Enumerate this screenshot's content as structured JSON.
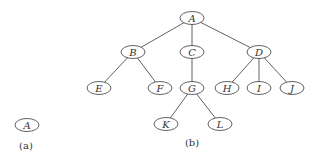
{
  "diagram": {
    "type": "tree",
    "panels": [
      {
        "id": "a",
        "caption": "(a)",
        "nodes": [
          {
            "id": "a_A",
            "label": "A",
            "x": 27,
            "y": 125
          }
        ],
        "edges": []
      },
      {
        "id": "b",
        "caption": "(b)",
        "nodes": [
          {
            "id": "A",
            "label": "A",
            "x": 192,
            "y": 18
          },
          {
            "id": "B",
            "label": "B",
            "x": 133,
            "y": 52
          },
          {
            "id": "C",
            "label": "C",
            "x": 192,
            "y": 52
          },
          {
            "id": "D",
            "label": "D",
            "x": 259,
            "y": 52
          },
          {
            "id": "E",
            "label": "E",
            "x": 99,
            "y": 88
          },
          {
            "id": "F",
            "label": "F",
            "x": 160,
            "y": 88
          },
          {
            "id": "G",
            "label": "G",
            "x": 192,
            "y": 88
          },
          {
            "id": "H",
            "label": "H",
            "x": 227,
            "y": 88
          },
          {
            "id": "I",
            "label": "I",
            "x": 259,
            "y": 88
          },
          {
            "id": "J",
            "label": "J",
            "x": 292,
            "y": 88
          },
          {
            "id": "K",
            "label": "K",
            "x": 166,
            "y": 124
          },
          {
            "id": "L",
            "label": "L",
            "x": 220,
            "y": 124
          }
        ],
        "edges": [
          [
            "A",
            "B"
          ],
          [
            "A",
            "C"
          ],
          [
            "A",
            "D"
          ],
          [
            "B",
            "E"
          ],
          [
            "B",
            "F"
          ],
          [
            "C",
            "G"
          ],
          [
            "D",
            "H"
          ],
          [
            "D",
            "I"
          ],
          [
            "D",
            "J"
          ],
          [
            "G",
            "K"
          ],
          [
            "G",
            "L"
          ]
        ]
      }
    ]
  },
  "labels": {
    "panel_a": {
      "node_A": "A",
      "caption": "(a)"
    },
    "panel_b": {
      "A": "A",
      "B": "B",
      "C": "C",
      "D": "D",
      "E": "E",
      "F": "F",
      "G": "G",
      "H": "H",
      "I": "I",
      "J": "J",
      "K": "K",
      "L": "L",
      "caption": "(b)"
    }
  }
}
